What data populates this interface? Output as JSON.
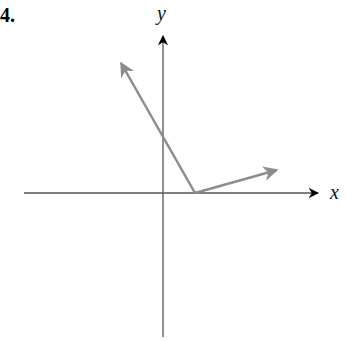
{
  "problem_number": "4.",
  "axes": {
    "x_label": "x",
    "y_label": "y",
    "axis_color": "#555555",
    "arrowhead_color": "#000000"
  },
  "vectors": {
    "color": "#8c8c8c",
    "items": [
      {
        "name": "vector-up-left",
        "from": [
          195,
          193
        ],
        "to": [
          121,
          63
        ]
      },
      {
        "name": "vector-up-right",
        "from": [
          195,
          193
        ],
        "to": [
          277,
          170
        ]
      }
    ]
  }
}
